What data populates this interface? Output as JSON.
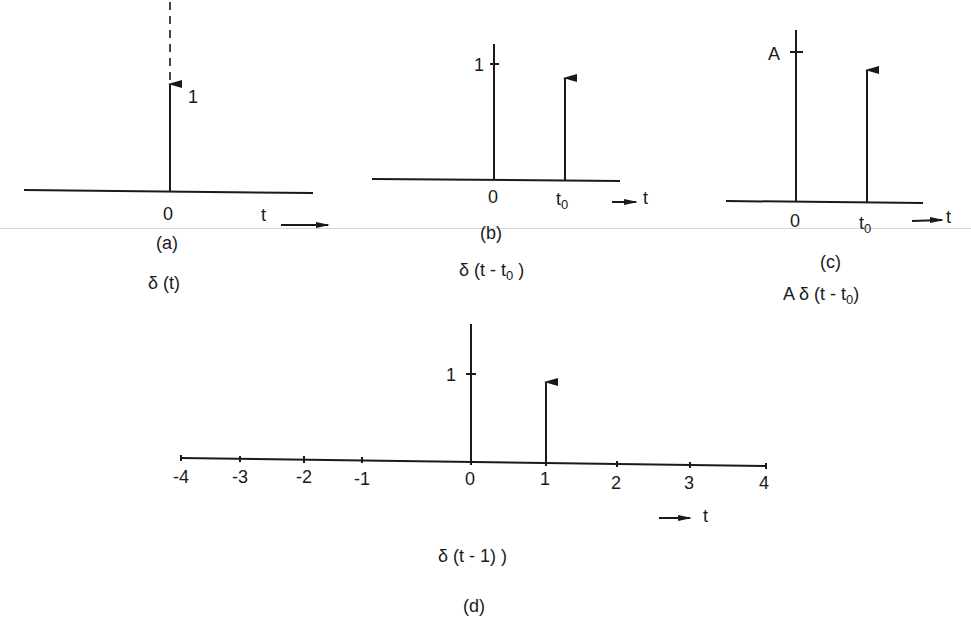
{
  "figure": {
    "scanline_color": "#d8d8d8",
    "ink_color": "#1a1a1a",
    "panels": [
      {
        "id": "a",
        "caption": "(a)",
        "formula": "δ (t)",
        "impulse_label": "1",
        "origin_label": "0",
        "axis_label": "t"
      },
      {
        "id": "b",
        "caption": "(b)",
        "formula_prefix": "δ  (t - t",
        "formula_sub": "0",
        "formula_suffix": " )",
        "tick_label": "1",
        "origin_label": "0",
        "shift_label": "t",
        "shift_sub": "0",
        "axis_label": "t"
      },
      {
        "id": "c",
        "caption": "(c)",
        "formula_prefix": "A  δ (t - t",
        "formula_sub": "0",
        "formula_suffix": ")",
        "tick_label": "A",
        "origin_label": "0",
        "shift_label": "t",
        "shift_sub": "0",
        "axis_label": "t"
      },
      {
        "id": "d",
        "caption": "(d)",
        "formula": "δ (t - 1) )",
        "tick_label": "1",
        "axis_label": "t",
        "ticks": [
          "-4",
          "-3",
          "-2",
          "-1",
          "0",
          "1",
          "2",
          "3",
          "4"
        ]
      }
    ]
  }
}
